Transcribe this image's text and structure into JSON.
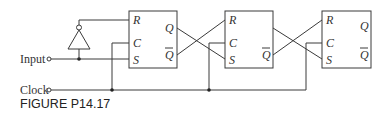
{
  "figure": {
    "caption": "FIGURE P14.17",
    "inputs": {
      "input_label": "Input",
      "clock_label": "Clock"
    },
    "flip_flops": [
      {
        "id": "ff1",
        "pins_in": [
          "R",
          "C",
          "S"
        ],
        "pins_out": [
          "Q",
          "Q̄"
        ]
      },
      {
        "id": "ff2",
        "pins_in": [
          "R",
          "C",
          "S"
        ],
        "pins_out": [
          "Q",
          "Q̄"
        ]
      },
      {
        "id": "ff3",
        "pins_in": [
          "R",
          "C",
          "S"
        ],
        "pins_out": [
          "Q",
          "Q̄"
        ]
      }
    ],
    "gates": [
      {
        "type": "inverter",
        "input": "Input",
        "output": "ff1.R"
      }
    ],
    "connections": [
      "Input -> ff1.S",
      "Input -> inverter -> ff1.R",
      "ff1.Q -> ff2.S",
      "ff1.Q̄ -> ff2.R",
      "ff2.Q -> ff3.S",
      "ff2.Q̄ -> ff3.R",
      "Clock -> ff1.C, ff2.C, ff3.C"
    ],
    "colors": {
      "line": "#3a3a3a",
      "background": "#ffffff"
    }
  }
}
